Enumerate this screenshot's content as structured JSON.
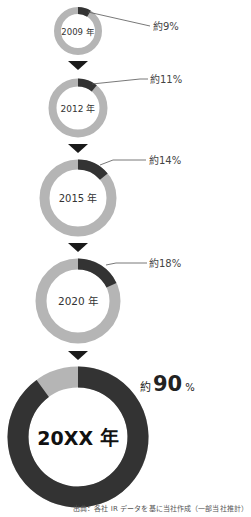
{
  "chart_data": {
    "type": "pie",
    "subtype": "donut-sequence",
    "title": "",
    "series": [
      {
        "name": "2009 年",
        "year_label": "2009 年",
        "value": 9,
        "label": "約9%"
      },
      {
        "name": "2012 年",
        "year_label": "2012 年",
        "value": 11,
        "label": "約11%"
      },
      {
        "name": "2015 年",
        "year_label": "2015 年",
        "value": 14,
        "label": "約14%"
      },
      {
        "name": "2020 年",
        "year_label": "2020 年",
        "value": 18,
        "label": "約18%"
      },
      {
        "name": "20XX 年",
        "year_label": "20XX 年",
        "value": 90,
        "label_prefix": "約",
        "label_value": "90",
        "label_suffix": "%"
      }
    ],
    "colors": {
      "share": "#333333",
      "rest": "#b5b5b5",
      "arrow": "#1a1a1a",
      "leader": "#555555"
    },
    "source": "出典：各社 IR データを基に当社作成（一部当社推計）"
  },
  "footer": {
    "source": "出典：各社 IR データを基に当社作成（一部当社推計）"
  }
}
